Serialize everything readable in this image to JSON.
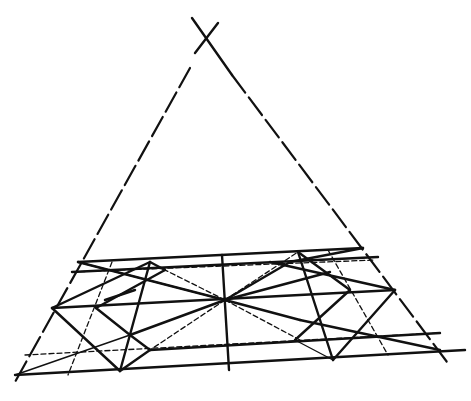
{
  "diagram": {
    "colors": {
      "ink": "#111111",
      "background": "#ffffff"
    },
    "apex": {
      "x": 208,
      "y": 38
    },
    "center_point": {
      "x": 225,
      "y": 300
    },
    "lines": [
      {
        "id": "apex-cross-a",
        "x1": 192,
        "y1": 18,
        "x2": 232,
        "y2": 75,
        "style": "solid"
      },
      {
        "id": "apex-cross-b",
        "x1": 218,
        "y1": 23,
        "x2": 195,
        "y2": 53,
        "style": "solid"
      },
      {
        "id": "left-side",
        "x1": 190,
        "y1": 68,
        "x2": 15,
        "y2": 382,
        "style": "dashthick"
      },
      {
        "id": "right-side",
        "x1": 232,
        "y1": 75,
        "x2": 450,
        "y2": 366,
        "style": "dashthick"
      },
      {
        "id": "h-top",
        "x1": 78,
        "y1": 262,
        "x2": 363,
        "y2": 248,
        "style": "solid"
      },
      {
        "id": "h-second",
        "x1": 72,
        "y1": 272,
        "x2": 378,
        "y2": 257,
        "style": "solid"
      },
      {
        "id": "h-second-dash",
        "x1": 72,
        "y1": 272,
        "x2": 375,
        "y2": 260,
        "style": "dash"
      },
      {
        "id": "h-middle",
        "x1": 52,
        "y1": 308,
        "x2": 395,
        "y2": 290,
        "style": "solid"
      },
      {
        "id": "h-lower-dash",
        "x1": 25,
        "y1": 355,
        "x2": 440,
        "y2": 333,
        "style": "dash"
      },
      {
        "id": "h-lower-solid",
        "x1": 150,
        "y1": 350,
        "x2": 440,
        "y2": 333,
        "style": "solid"
      },
      {
        "id": "h-bottom",
        "x1": 15,
        "y1": 375,
        "x2": 465,
        "y2": 350,
        "style": "solid"
      },
      {
        "id": "v-center",
        "x1": 222,
        "y1": 255,
        "x2": 229,
        "y2": 370,
        "style": "solid"
      },
      {
        "id": "v-left-dash",
        "x1": 112,
        "y1": 262,
        "x2": 68,
        "y2": 375,
        "style": "dash"
      },
      {
        "id": "v-left-solid",
        "x1": 150,
        "y1": 262,
        "x2": 120,
        "y2": 371,
        "style": "solid"
      },
      {
        "id": "v-right-solid",
        "x1": 298,
        "y1": 252,
        "x2": 333,
        "y2": 360,
        "style": "solid"
      },
      {
        "id": "v-right-dash",
        "x1": 328,
        "y1": 250,
        "x2": 388,
        "y2": 355,
        "style": "dash"
      },
      {
        "id": "diag-tl-center",
        "x1": 78,
        "y1": 262,
        "x2": 225,
        "y2": 300,
        "style": "solid"
      },
      {
        "id": "diag-l-center-a",
        "x1": 52,
        "y1": 308,
        "x2": 150,
        "y2": 262,
        "style": "solid"
      },
      {
        "id": "diag-l-center-b",
        "x1": 52,
        "y1": 308,
        "x2": 120,
        "y2": 371,
        "style": "solid"
      },
      {
        "id": "diag-c-bl",
        "x1": 225,
        "y1": 300,
        "x2": 130,
        "y2": 335,
        "style": "solid"
      },
      {
        "id": "diag-c-bl2",
        "x1": 130,
        "y1": 335,
        "x2": 15,
        "y2": 375,
        "style": "thin"
      },
      {
        "id": "diag-c-bl-dash",
        "x1": 225,
        "y1": 300,
        "x2": 150,
        "y2": 350,
        "style": "dash"
      },
      {
        "id": "diag-c-ul",
        "x1": 225,
        "y1": 300,
        "x2": 165,
        "y2": 270,
        "style": "dash"
      },
      {
        "id": "diag-ul-a",
        "x1": 150,
        "y1": 262,
        "x2": 165,
        "y2": 270,
        "style": "solid"
      },
      {
        "id": "diag-ul-b",
        "x1": 165,
        "y1": 270,
        "x2": 96,
        "y2": 308,
        "style": "solid"
      },
      {
        "id": "diag-inner-a",
        "x1": 96,
        "y1": 308,
        "x2": 130,
        "y2": 335,
        "style": "solid"
      },
      {
        "id": "diag-inner-b",
        "x1": 130,
        "y1": 335,
        "x2": 150,
        "y2": 350,
        "style": "solid"
      },
      {
        "id": "diag-inner-c",
        "x1": 150,
        "y1": 350,
        "x2": 120,
        "y2": 371,
        "style": "solid"
      },
      {
        "id": "diag-flare-a",
        "x1": 105,
        "y1": 300,
        "x2": 135,
        "y2": 290,
        "style": "solid"
      },
      {
        "id": "diag-c-ur-a",
        "x1": 225,
        "y1": 300,
        "x2": 290,
        "y2": 262,
        "style": "solid"
      },
      {
        "id": "diag-c-ur-b",
        "x1": 225,
        "y1": 300,
        "x2": 330,
        "y2": 272,
        "style": "solid"
      },
      {
        "id": "diag-c-ur-dash",
        "x1": 225,
        "y1": 300,
        "x2": 298,
        "y2": 252,
        "style": "dash"
      },
      {
        "id": "diag-ur-a",
        "x1": 298,
        "y1": 252,
        "x2": 350,
        "y2": 290,
        "style": "solid"
      },
      {
        "id": "diag-ur-b",
        "x1": 270,
        "y1": 262,
        "x2": 395,
        "y2": 290,
        "style": "solid"
      },
      {
        "id": "diag-ur-c",
        "x1": 363,
        "y1": 248,
        "x2": 290,
        "y2": 262,
        "style": "solid"
      },
      {
        "id": "diag-c-r",
        "x1": 225,
        "y1": 300,
        "x2": 300,
        "y2": 320,
        "style": "solid"
      },
      {
        "id": "diag-r-a",
        "x1": 300,
        "y1": 320,
        "x2": 440,
        "y2": 350,
        "style": "solid"
      },
      {
        "id": "diag-c-r-dash",
        "x1": 225,
        "y1": 300,
        "x2": 300,
        "y2": 340,
        "style": "dash"
      },
      {
        "id": "diag-rr-a",
        "x1": 350,
        "y1": 290,
        "x2": 295,
        "y2": 340,
        "style": "solid"
      },
      {
        "id": "diag-rr-b",
        "x1": 395,
        "y1": 290,
        "x2": 333,
        "y2": 360,
        "style": "solid"
      },
      {
        "id": "diag-rr-c",
        "x1": 295,
        "y1": 340,
        "x2": 333,
        "y2": 360,
        "style": "thin"
      },
      {
        "id": "diag-c-l-far",
        "x1": 225,
        "y1": 300,
        "x2": 78,
        "y2": 262,
        "style": "thin"
      }
    ]
  }
}
